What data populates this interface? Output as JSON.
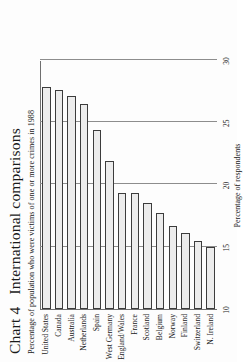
{
  "figure": {
    "title_number": "Chart 4",
    "title_text": "International comparisons",
    "subtitle": "Percentage of population who were victims of one or more crimes in 1988"
  },
  "chart_data": {
    "type": "bar",
    "orientation": "vertical-printed-sideways",
    "subtitle": "Percentage of population who were victims of one or more crimes in 1988",
    "xlabel": "",
    "ylabel": "Percentage of respondents",
    "ylim": [
      10,
      30
    ],
    "yticks": [
      10,
      15,
      20,
      25,
      30
    ],
    "ytick_labels": [
      "10",
      "15",
      "20",
      "25",
      "30"
    ],
    "grid": true,
    "legend": false,
    "categories": [
      "United States",
      "Canada",
      "Australia",
      "Netherlands",
      "Spain",
      "West Germany",
      "England/Wales",
      "France",
      "Scotland",
      "Belgium",
      "Norway",
      "Finland",
      "Switzerland",
      "N. Ireland"
    ],
    "values": [
      27.8,
      27.6,
      27.1,
      26.5,
      24.4,
      21.9,
      19.3,
      19.3,
      18.5,
      17.7,
      16.7,
      16.1,
      15.5,
      15.0
    ],
    "colors": {
      "bar_fill": "#ececec",
      "bar_stroke": "#3c3c3c",
      "gridline": "#8d8d8d",
      "axis": "#6f6f6f",
      "text": "#1a1a1a",
      "background": "#fdfdfd"
    }
  }
}
